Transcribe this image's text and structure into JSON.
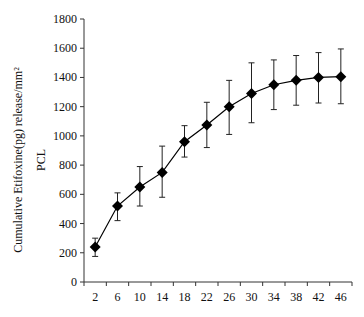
{
  "chart_data": {
    "type": "line",
    "title": "",
    "xlabel": "",
    "ylabel": "Cumulative Etifoxine(pg) release/mm²",
    "ylabel_line2": "PCL",
    "categories": [
      "2",
      "6",
      "10",
      "14",
      "18",
      "22",
      "26",
      "30",
      "34",
      "38",
      "42",
      "46"
    ],
    "series": [
      {
        "name": "PCL",
        "values": [
          240,
          520,
          650,
          750,
          960,
          1075,
          1200,
          1290,
          1350,
          1380,
          1400,
          1405
        ],
        "error_upper": [
          300,
          610,
          790,
          930,
          1070,
          1230,
          1380,
          1500,
          1520,
          1550,
          1570,
          1595
        ],
        "error_lower": [
          175,
          420,
          520,
          580,
          855,
          920,
          1010,
          1090,
          1180,
          1210,
          1225,
          1220
        ],
        "marker": "diamond",
        "color": "#000000"
      }
    ],
    "ylim": [
      0,
      1800
    ],
    "yticks": [
      0,
      200,
      400,
      600,
      800,
      1000,
      1200,
      1400,
      1600,
      1800
    ],
    "grid": false,
    "legend": "none"
  }
}
